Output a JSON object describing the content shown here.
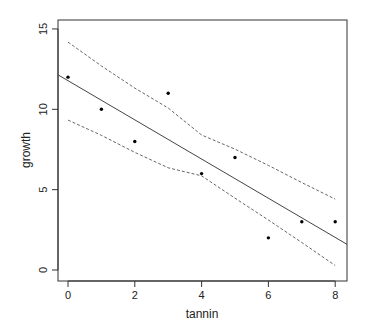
{
  "chart_data": {
    "type": "scatter",
    "title": "",
    "xlabel": "tannin",
    "ylabel": "growth",
    "xlim": [
      -0.32,
      8.35
    ],
    "ylim": [
      -0.7,
      15.5
    ],
    "xticks": [
      0,
      2,
      4,
      6,
      8
    ],
    "yticks": [
      0,
      5,
      10,
      15
    ],
    "grid": false,
    "points": {
      "x": [
        0,
        1,
        2,
        3,
        4,
        5,
        6,
        7,
        8
      ],
      "y": [
        12,
        10,
        8,
        11,
        6,
        7,
        2,
        3,
        3
      ]
    },
    "regression": {
      "intercept": 11.756,
      "slope": -1.2167,
      "style": "solid"
    },
    "confidence_band": {
      "style": "dashed",
      "x": [
        0,
        1,
        2,
        3,
        4,
        5,
        6,
        7,
        8
      ],
      "upper": [
        14.18,
        12.7,
        11.32,
        10.08,
        8.4,
        7.52,
        6.51,
        5.44,
        4.41
      ],
      "lower": [
        9.33,
        8.38,
        7.32,
        6.36,
        5.86,
        4.47,
        3.11,
        1.71,
        0.28
      ]
    }
  },
  "labels": {
    "xlabel": "tannin",
    "ylabel": "growth",
    "xticks": [
      "0",
      "2",
      "4",
      "6",
      "8"
    ],
    "yticks": [
      "0",
      "5",
      "10",
      "15"
    ]
  }
}
